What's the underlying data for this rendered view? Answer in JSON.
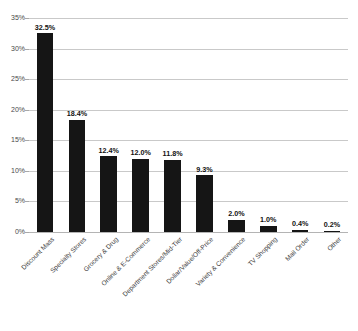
{
  "chart_data": {
    "type": "bar",
    "title": "",
    "xlabel": "",
    "ylabel": "",
    "ylim": [
      0,
      35
    ],
    "ytick_labels": [
      "0%",
      "5%",
      "10%",
      "15%",
      "20%",
      "25%",
      "30%",
      "35%"
    ],
    "ytick_values": [
      0,
      5,
      10,
      15,
      20,
      25,
      30,
      35
    ],
    "grid": true,
    "legend": "none",
    "bar_color": "#151515",
    "gridline_color": "#c9c9c9",
    "categories": [
      "Discount Mass",
      "Specialty Stores",
      "Grocery & Drug",
      "Online & E-Commerce",
      "Department Stores/Mid-Tier",
      "Dollar/Value/Off-Price",
      "Variety & Convenience",
      "TV Shopping",
      "Mail Order",
      "Other"
    ],
    "values": [
      32.5,
      18.4,
      12.4,
      12.0,
      11.8,
      9.3,
      2.0,
      1.0,
      0.4,
      0.2
    ],
    "value_labels": [
      "32.5%",
      "18.4%",
      "12.4%",
      "12.0%",
      "11.8%",
      "9.3%",
      "2.0%",
      "1.0%",
      "0.4%",
      "0.2%"
    ]
  }
}
